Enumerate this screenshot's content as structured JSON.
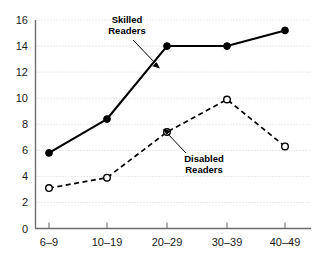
{
  "chart_data": {
    "type": "line",
    "title": "",
    "xlabel": "",
    "ylabel": "",
    "categories": [
      "6–9",
      "10–19",
      "20–29",
      "30–39",
      "40–49"
    ],
    "ylim": [
      0,
      16
    ],
    "y_ticks": [
      0,
      2,
      4,
      6,
      8,
      10,
      12,
      14,
      16
    ],
    "y_tick_labels": [
      "0",
      "2",
      "4",
      "6",
      "8",
      "10",
      "12",
      "14",
      "16"
    ],
    "grid": true,
    "legend_position": "inline-annotations",
    "series": [
      {
        "name": "Skilled Readers",
        "style": "solid",
        "marker": "filled-circle",
        "values": [
          5.8,
          8.4,
          14.0,
          14.0,
          15.2
        ]
      },
      {
        "name": "Disabled Readers",
        "style": "dashed",
        "marker": "open-circle",
        "values": [
          3.1,
          3.9,
          7.4,
          9.9,
          6.3
        ]
      }
    ],
    "annotations": [
      {
        "text_line1": "Skilled",
        "text_line2": "Readers"
      },
      {
        "text_line1": "Disabled",
        "text_line2": "Readers"
      }
    ]
  },
  "labels": {
    "skilled_line1": "Skilled",
    "skilled_line2": "Readers",
    "disabled_line1": "Disabled",
    "disabled_line2": "Readers"
  },
  "colors": {
    "background": "#ffffff",
    "line": "#000000",
    "grid": "#c9c9c9",
    "axis": "#6e6e6e",
    "text": "#1a1a1a"
  }
}
